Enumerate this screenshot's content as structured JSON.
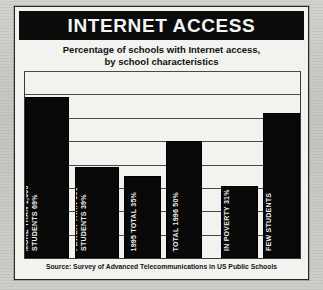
{
  "figure": {
    "title": "INTERNET ACCESS",
    "source": "Source: Survey of Advanced Telecommunications in US Public Schools",
    "subtitle_line1": "Percentage of schools with Internet access,",
    "subtitle_line2": "by school characteristics",
    "colors": {
      "banner_background": "#0b0b0b",
      "banner_text": "#f4f4f4",
      "bar_fill": "#080808",
      "bar_label_text": "#ededed",
      "panel_background": "#f2f2ef",
      "gridline": "#4a4a4a",
      "page_background": "#c9c9c4"
    }
  },
  "chart_data": {
    "type": "bar",
    "title": "INTERNET ACCESS",
    "subtitle": "Percentage of schools with Internet access, by school characteristics",
    "xlabel": "",
    "ylabel": "Percentage of schools",
    "ylim": [
      0,
      80
    ],
    "grid": true,
    "gridline_values": [
      10,
      20,
      30,
      40,
      50,
      60,
      70,
      80
    ],
    "legend": "none",
    "categories": [
      "MORE THAN 1,000 STUDENTS",
      "FEWER THAN 300 STUDENTS",
      "1995 TOTAL",
      "TOTAL 1996",
      "MANY STUDENTS IN POVERTY",
      "IN POVERTY FEW STUDENTS"
    ],
    "values": [
      69,
      39,
      35,
      50,
      31,
      62
    ],
    "bars": [
      {
        "value": 69,
        "label_lines": [
          "MORE THAN 1,000",
          "STUDENTS  69%"
        ],
        "group": "school-size"
      },
      {
        "value": 39,
        "label_lines": [
          "FEWER THAN 300",
          "STUDENTS  39%"
        ],
        "group": "school-size"
      },
      {
        "value": 35,
        "label_lines": [
          "1995 TOTAL  35%"
        ],
        "group": "totals"
      },
      {
        "value": 50,
        "label_lines": [
          "TOTAL 1996  50%"
        ],
        "group": "totals"
      },
      {
        "value": 31,
        "label_lines": [
          "MANY STUDENTS",
          "IN POVERTY  31%"
        ],
        "group": "poverty"
      },
      {
        "value": 62,
        "label_lines": [
          "IN POVERTY  62%",
          "FEW STUDENTS"
        ],
        "group": "poverty"
      }
    ]
  }
}
